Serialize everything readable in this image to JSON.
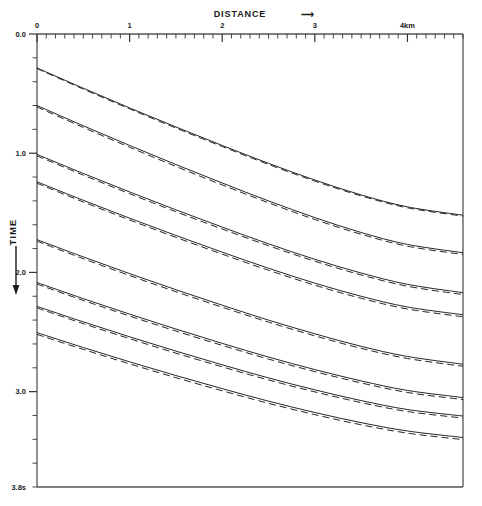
{
  "chart_data": {
    "type": "line",
    "title": "",
    "xlabel": "DISTANCE",
    "xlabel_arrow": "⟶",
    "ylabel": "TIME",
    "ylabel_arrow": "↓",
    "x_unit": "km",
    "y_unit": "s",
    "xlim": [
      0,
      4.6
    ],
    "ylim": [
      3.8,
      0.0
    ],
    "y_inverted": true,
    "grid": false,
    "legend": null,
    "x_tick_labels": [
      "0",
      "1",
      "2",
      "3",
      "4km"
    ],
    "x_tick_values": [
      0,
      1,
      2,
      3,
      4
    ],
    "x_minor_per_major": 10,
    "y_tick_labels": [
      "0.0",
      "1.0",
      "2.0",
      "3.0",
      "3.8s"
    ],
    "y_tick_values": [
      0.0,
      1.0,
      2.0,
      3.0,
      3.8
    ],
    "y_minor_per_major": 5,
    "axis_position": {
      "x_axis": "top",
      "y_axis": "left"
    },
    "series": [
      {
        "name": "branch-1-observed",
        "style": "solid",
        "x": [
          0.0,
          0.5,
          1.0,
          1.5,
          2.0,
          2.5,
          3.0,
          3.5,
          4.0,
          4.6
        ],
        "y": [
          0.285,
          0.455,
          0.62,
          0.78,
          0.935,
          1.085,
          1.225,
          1.35,
          1.45,
          1.52
        ]
      },
      {
        "name": "branch-1-calculated",
        "style": "dashed",
        "x": [
          0.0,
          0.5,
          1.0,
          1.5,
          2.0,
          2.5,
          3.0,
          3.5,
          4.0,
          4.6
        ],
        "y": [
          0.29,
          0.462,
          0.628,
          0.789,
          0.944,
          1.094,
          1.234,
          1.358,
          1.458,
          1.528
        ]
      },
      {
        "name": "branch-2-observed",
        "style": "solid",
        "x": [
          0.0,
          0.5,
          1.0,
          1.5,
          2.0,
          2.5,
          3.0,
          3.5,
          4.0,
          4.6
        ],
        "y": [
          0.6,
          0.77,
          0.935,
          1.095,
          1.25,
          1.4,
          1.54,
          1.665,
          1.765,
          1.835
        ]
      },
      {
        "name": "branch-2-calculated",
        "style": "dashed",
        "x": [
          0.0,
          0.5,
          1.0,
          1.5,
          2.0,
          2.5,
          3.0,
          3.5,
          4.0,
          4.6
        ],
        "y": [
          0.612,
          0.784,
          0.95,
          1.111,
          1.266,
          1.416,
          1.556,
          1.68,
          1.78,
          1.85
        ]
      },
      {
        "name": "branch-3-observed",
        "style": "solid",
        "x": [
          0.0,
          0.5,
          1.0,
          1.5,
          2.0,
          2.5,
          3.0,
          3.5,
          4.0,
          4.6
        ],
        "y": [
          1.01,
          1.17,
          1.325,
          1.475,
          1.62,
          1.76,
          1.89,
          2.005,
          2.1,
          2.17
        ]
      },
      {
        "name": "branch-3-calculated",
        "style": "dashed",
        "x": [
          0.0,
          0.5,
          1.0,
          1.5,
          2.0,
          2.5,
          3.0,
          3.5,
          4.0,
          4.6
        ],
        "y": [
          1.022,
          1.184,
          1.34,
          1.491,
          1.636,
          1.776,
          1.906,
          2.021,
          2.116,
          2.186
        ]
      },
      {
        "name": "branch-4-observed",
        "style": "solid",
        "x": [
          0.0,
          0.5,
          1.0,
          1.5,
          2.0,
          2.5,
          3.0,
          3.5,
          4.0,
          4.6
        ],
        "y": [
          1.24,
          1.395,
          1.545,
          1.69,
          1.83,
          1.965,
          2.09,
          2.2,
          2.29,
          2.355
        ]
      },
      {
        "name": "branch-4-calculated",
        "style": "dashed",
        "x": [
          0.0,
          0.5,
          1.0,
          1.5,
          2.0,
          2.5,
          3.0,
          3.5,
          4.0,
          4.6
        ],
        "y": [
          1.252,
          1.409,
          1.56,
          1.706,
          1.847,
          1.982,
          2.107,
          2.217,
          2.307,
          2.372
        ]
      },
      {
        "name": "branch-5-observed",
        "style": "solid",
        "x": [
          0.0,
          0.5,
          1.0,
          1.5,
          2.0,
          2.5,
          3.0,
          3.5,
          4.0,
          4.6
        ],
        "y": [
          1.725,
          1.87,
          2.01,
          2.145,
          2.275,
          2.4,
          2.515,
          2.62,
          2.705,
          2.77
        ]
      },
      {
        "name": "branch-5-calculated",
        "style": "dashed",
        "x": [
          0.0,
          0.5,
          1.0,
          1.5,
          2.0,
          2.5,
          3.0,
          3.5,
          4.0,
          4.6
        ],
        "y": [
          1.738,
          1.885,
          2.026,
          2.162,
          2.292,
          2.417,
          2.532,
          2.637,
          2.722,
          2.787
        ]
      },
      {
        "name": "branch-6-observed",
        "style": "solid",
        "x": [
          0.0,
          0.5,
          1.0,
          1.5,
          2.0,
          2.5,
          3.0,
          3.5,
          4.0,
          4.6
        ],
        "y": [
          2.085,
          2.22,
          2.35,
          2.475,
          2.595,
          2.71,
          2.815,
          2.91,
          2.99,
          3.05
        ]
      },
      {
        "name": "branch-6-calculated",
        "style": "dashed",
        "x": [
          0.0,
          0.5,
          1.0,
          1.5,
          2.0,
          2.5,
          3.0,
          3.5,
          4.0,
          4.6
        ],
        "y": [
          2.098,
          2.235,
          2.366,
          2.492,
          2.612,
          2.727,
          2.832,
          2.927,
          3.007,
          3.067
        ]
      },
      {
        "name": "branch-7-observed",
        "style": "solid",
        "x": [
          0.0,
          0.5,
          1.0,
          1.5,
          2.0,
          2.5,
          3.0,
          3.5,
          4.0,
          4.6
        ],
        "y": [
          2.285,
          2.415,
          2.54,
          2.66,
          2.775,
          2.885,
          2.985,
          3.075,
          3.15,
          3.205
        ]
      },
      {
        "name": "branch-7-calculated",
        "style": "dashed",
        "x": [
          0.0,
          0.5,
          1.0,
          1.5,
          2.0,
          2.5,
          3.0,
          3.5,
          4.0,
          4.6
        ],
        "y": [
          2.298,
          2.43,
          2.556,
          2.677,
          2.792,
          2.902,
          3.002,
          3.092,
          3.167,
          3.222
        ]
      },
      {
        "name": "branch-8-observed",
        "style": "solid",
        "x": [
          0.0,
          0.5,
          1.0,
          1.5,
          2.0,
          2.5,
          3.0,
          3.5,
          4.0,
          4.6
        ],
        "y": [
          2.505,
          2.63,
          2.75,
          2.865,
          2.975,
          3.08,
          3.175,
          3.26,
          3.33,
          3.385
        ]
      },
      {
        "name": "branch-8-calculated",
        "style": "dashed",
        "x": [
          0.0,
          0.5,
          1.0,
          1.5,
          2.0,
          2.5,
          3.0,
          3.5,
          4.0,
          4.6
        ],
        "y": [
          2.52,
          2.646,
          2.767,
          2.883,
          2.993,
          3.098,
          3.193,
          3.278,
          3.348,
          3.403
        ]
      }
    ]
  },
  "axes": {
    "distance_label": "DISTANCE",
    "distance_arrow": "⟶",
    "time_label": "TIME",
    "time_arrow": "↓",
    "x_ticks": [
      "0",
      "1",
      "2",
      "3",
      "4km"
    ],
    "y_ticks": [
      "0.0",
      "1.0",
      "2.0",
      "3.0",
      "3.8s"
    ]
  },
  "colors": {
    "line": "#1a1a1a",
    "axis": "#4a4a4a",
    "background": "#ffffff"
  }
}
